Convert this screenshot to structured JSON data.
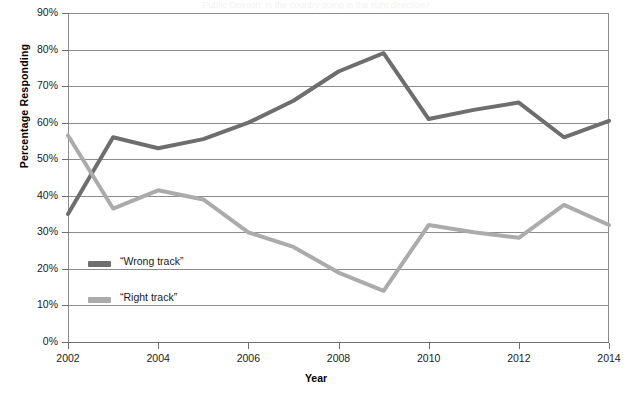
{
  "chart_data": {
    "type": "line",
    "title": "Public Opinion: Is the country going in the right direction?",
    "xlabel": "Year",
    "ylabel": "Percentage Responding",
    "x": [
      2002,
      2003,
      2004,
      2005,
      2006,
      2007,
      2008,
      2009,
      2010,
      2011,
      2012,
      2013,
      2014
    ],
    "xlim": [
      2002,
      2014
    ],
    "ylim": [
      0,
      90
    ],
    "xticks": [
      2002,
      2004,
      2006,
      2008,
      2010,
      2012,
      2014
    ],
    "xtick_labels": [
      "2002",
      "2004",
      "2006",
      "2008",
      "2010",
      "2012",
      "2014"
    ],
    "yticks": [
      0,
      10,
      20,
      30,
      40,
      50,
      60,
      70,
      80,
      90
    ],
    "ytick_labels": [
      "0%",
      "10%",
      "20%",
      "30%",
      "40%",
      "50%",
      "60%",
      "70%",
      "80%",
      "90%"
    ],
    "grid": true,
    "legend_position": "inside-lower-left",
    "series": [
      {
        "name": "“Wrong track”",
        "color": "#6e6e6e",
        "values": [
          35,
          56,
          53,
          55.5,
          60,
          66,
          74,
          79,
          61,
          63.5,
          65.5,
          56,
          60.5
        ]
      },
      {
        "name": "“Right track”",
        "color": "#ababab",
        "values": [
          56.5,
          36.5,
          41.5,
          39,
          30,
          26,
          19,
          14,
          32,
          30,
          28.5,
          37.5,
          32
        ]
      }
    ]
  },
  "axes": {
    "ylabel": "Percentage Responding",
    "xlabel": "Year"
  },
  "legend": {
    "items": [
      {
        "label": "“Wrong track”",
        "color": "#6e6e6e"
      },
      {
        "label": "“Right track”",
        "color": "#ababab"
      }
    ]
  }
}
